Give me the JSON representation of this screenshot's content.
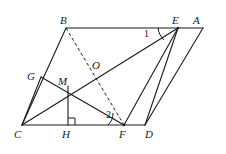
{
  "figure": {
    "type": "geometry-diagram",
    "canvas": {
      "width": 226,
      "height": 154
    },
    "stroke_color": "#1a1a1a",
    "label_color": "#1a1a1a",
    "background": "#ffffff"
  },
  "points": {
    "A": {
      "label": "A",
      "x": 203,
      "y": 28,
      "label_x": 193,
      "label_y": 15
    },
    "B": {
      "label": "B",
      "x": 66,
      "y": 28,
      "label_x": 60,
      "label_y": 15
    },
    "C": {
      "label": "C",
      "x": 22,
      "y": 125,
      "label_x": 14,
      "label_y": 129
    },
    "D": {
      "label": "D",
      "x": 145,
      "y": 125,
      "label_x": 145,
      "label_y": 129
    },
    "E": {
      "label": "E",
      "x": 178,
      "y": 28,
      "label_x": 172,
      "label_y": 15
    },
    "F": {
      "label": "F",
      "x": 124,
      "y": 125,
      "label_x": 119,
      "label_y": 129
    },
    "G": {
      "label": "G",
      "x": 41,
      "y": 77,
      "label_x": 27,
      "label_y": 71
    },
    "H": {
      "label": "H",
      "x": 68,
      "y": 125,
      "label_x": 62,
      "label_y": 129
    },
    "M": {
      "label": "M",
      "x": 68,
      "y": 86,
      "label_x": 58,
      "label_y": 76
    },
    "O": {
      "label": "O",
      "x": 97,
      "y": 73,
      "label_x": 92,
      "label_y": 60
    }
  },
  "segments": [
    {
      "name": "segment-B-A",
      "from": "B",
      "to": "A",
      "style": "solid"
    },
    {
      "name": "segment-C-D",
      "from": "C",
      "to": "D",
      "style": "solid"
    },
    {
      "name": "segment-B-C",
      "from": "B",
      "to": "C",
      "style": "solid"
    },
    {
      "name": "segment-E-D",
      "from": "E",
      "to": "D",
      "style": "solid"
    },
    {
      "name": "segment-A-D",
      "from": "A",
      "to": "D",
      "style": "solid"
    },
    {
      "name": "segment-C-E",
      "from": "C",
      "to": "E",
      "style": "solid"
    },
    {
      "name": "segment-E-F",
      "from": "E",
      "to": "F",
      "style": "solid"
    },
    {
      "name": "segment-C-G",
      "from": "C",
      "to": "G",
      "style": "solid"
    },
    {
      "name": "segment-G-F",
      "from": "G",
      "to": "F",
      "style": "solid"
    },
    {
      "name": "segment-M-H",
      "from": "M",
      "to": "H",
      "style": "solid"
    },
    {
      "name": "segment-B-F-dashed",
      "from": "B",
      "to": "F",
      "style": "dashed"
    }
  ],
  "angles": [
    {
      "name": "angle-1",
      "label": "1",
      "vertex": "E",
      "label_x": 144,
      "label_y": 29
    },
    {
      "name": "angle-2",
      "label": "2",
      "vertex": "F",
      "label_x": 106,
      "label_y": 110
    }
  ],
  "marks": [
    {
      "name": "right-angle-mark-H",
      "at": "H",
      "type": "right-angle-square"
    }
  ]
}
